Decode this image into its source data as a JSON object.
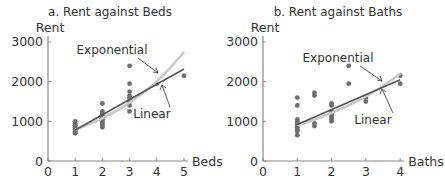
{
  "chart_data": [
    {
      "type": "scatter",
      "title": "a. Rent against Beds",
      "xlabel": "Beds",
      "ylabel": "Rent",
      "xlim": [
        0,
        5
      ],
      "ylim": [
        0,
        3000
      ],
      "xticks": [
        "0",
        "1",
        "2",
        "3",
        "4",
        "5"
      ],
      "yticks": [
        "0",
        "1000",
        "2000",
        "3000"
      ],
      "grid": false,
      "points": [
        [
          1,
          700
        ],
        [
          1,
          750
        ],
        [
          1,
          800
        ],
        [
          1,
          850
        ],
        [
          1,
          900
        ],
        [
          1,
          950
        ],
        [
          1,
          1000
        ],
        [
          1,
          780
        ],
        [
          1,
          720
        ],
        [
          1,
          880
        ],
        [
          2,
          850
        ],
        [
          2,
          900
        ],
        [
          2,
          950
        ],
        [
          2,
          1000
        ],
        [
          2,
          1050
        ],
        [
          2,
          1100
        ],
        [
          2,
          1150
        ],
        [
          2,
          1200
        ],
        [
          2,
          1250
        ],
        [
          2,
          1450
        ],
        [
          3,
          1250
        ],
        [
          3,
          1400
        ],
        [
          3,
          1500
        ],
        [
          3,
          1550
        ],
        [
          3,
          1600
        ],
        [
          3,
          1650
        ],
        [
          3,
          1750
        ],
        [
          3,
          1950
        ],
        [
          3,
          2400
        ],
        [
          4,
          1950
        ],
        [
          5,
          2150
        ]
      ],
      "series": [
        {
          "name": "Linear",
          "x": [
            1,
            5
          ],
          "y": [
            780,
            2320
          ]
        },
        {
          "name": "Exponential",
          "x": [
            1,
            2,
            3,
            4,
            5
          ],
          "y": [
            790,
            1080,
            1470,
            2000,
            2750
          ]
        }
      ],
      "annotations": [
        {
          "text": "Exponential",
          "points_to": "exponential curve near x=4"
        },
        {
          "text": "Linear",
          "points_to": "linear line near x=4"
        }
      ]
    },
    {
      "type": "scatter",
      "title": "b. Rent against Baths",
      "xlabel": "Baths",
      "ylabel": "Rent",
      "xlim": [
        0,
        4
      ],
      "ylim": [
        0,
        3000
      ],
      "xticks": [
        "0",
        "1",
        "2",
        "3",
        "4"
      ],
      "yticks": [
        "0",
        "1000",
        "2000",
        "3000"
      ],
      "grid": false,
      "points": [
        [
          1,
          650
        ],
        [
          1,
          750
        ],
        [
          1,
          800
        ],
        [
          1,
          850
        ],
        [
          1,
          900
        ],
        [
          1,
          950
        ],
        [
          1,
          1000
        ],
        [
          1,
          1050
        ],
        [
          1,
          1400
        ],
        [
          1,
          1600
        ],
        [
          1.5,
          880
        ],
        [
          1.5,
          950
        ],
        [
          1.5,
          1650
        ],
        [
          1.5,
          1720
        ],
        [
          2,
          1000
        ],
        [
          2,
          1050
        ],
        [
          2,
          1100
        ],
        [
          2,
          1150
        ],
        [
          2,
          1200
        ],
        [
          2,
          1250
        ],
        [
          2,
          1400
        ],
        [
          2,
          1450
        ],
        [
          2.5,
          1950
        ],
        [
          2.5,
          2400
        ],
        [
          3,
          1500
        ],
        [
          3,
          1600
        ],
        [
          4,
          1950
        ],
        [
          4,
          2150
        ]
      ],
      "series": [
        {
          "name": "Linear",
          "x": [
            1,
            4
          ],
          "y": [
            920,
            2050
          ]
        },
        {
          "name": "Exponential",
          "x": [
            1,
            2,
            3,
            4
          ],
          "y": [
            900,
            1250,
            1650,
            2200
          ]
        }
      ],
      "annotations": [
        {
          "text": "Exponential",
          "points_to": "exponential curve near x=3.5"
        },
        {
          "text": "Linear",
          "points_to": "linear line near x=3.5"
        }
      ]
    }
  ],
  "colors": {
    "points": "#6e6e6e",
    "linear": "#555555",
    "exponential": "#c8c8c8",
    "axis": "#888888",
    "text": "#333333"
  }
}
